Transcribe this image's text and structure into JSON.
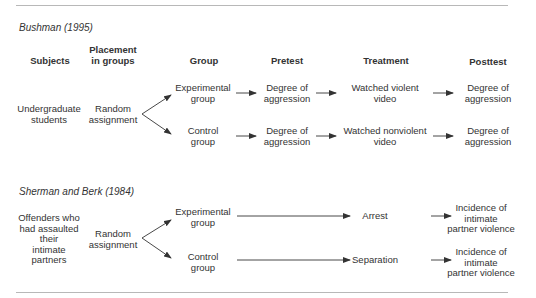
{
  "studies": [
    {
      "title": "Bushman (1995)",
      "headers": {
        "subjects": "Subjects",
        "placement_line1": "Placement",
        "placement_line2": "in groups",
        "group": "Group",
        "pretest": "Pretest",
        "treatment": "Treatment",
        "posttest": "Posttest"
      },
      "subjects": [
        "Undergraduate",
        "students"
      ],
      "placement": [
        "Random",
        "assignment"
      ],
      "groups": [
        {
          "name": [
            "Experimental",
            "group"
          ],
          "pretest": [
            "Degree of",
            "aggression"
          ],
          "treatment": [
            "Watched violent",
            "video"
          ],
          "posttest": [
            "Degree of",
            "aggression"
          ]
        },
        {
          "name": [
            "Control",
            "group"
          ],
          "pretest": [
            "Degree of",
            "aggression"
          ],
          "treatment": [
            "Watched nonviolent",
            "video"
          ],
          "posttest": [
            "Degree of",
            "aggression"
          ]
        }
      ]
    },
    {
      "title": "Sherman and Berk (1984)",
      "subjects": [
        "Offenders who",
        "had assaulted",
        "their",
        "intimate",
        "partners"
      ],
      "placement": [
        "Random",
        "assignment"
      ],
      "groups": [
        {
          "name": [
            "Experimental",
            "group"
          ],
          "treatment": "Arrest",
          "posttest": [
            "Incidence of",
            "intimate",
            "partner violence"
          ]
        },
        {
          "name": [
            "Control",
            "group"
          ],
          "treatment": "Separation",
          "posttest": [
            "Incidence of",
            "intimate",
            "partner violence"
          ]
        }
      ]
    }
  ],
  "colors": {
    "text": "#333333",
    "rule": "#b8b8b8",
    "arrow": "#333333"
  }
}
